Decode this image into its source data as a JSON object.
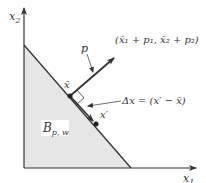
{
  "diagram": {
    "axes": {
      "x_label": "x",
      "x_label_sub": "1",
      "y_label": "x",
      "y_label_sub": "2"
    },
    "budget_set": {
      "label": "B",
      "label_sub": "p, w",
      "fill_color": "#e6e6e6"
    },
    "points": {
      "x_bar": "x̄",
      "x_prime": "x′"
    },
    "vectors": {
      "p_label": "p",
      "p_tip_label": "(x̄₁ + p₁, x̄₂ + p₂)",
      "delta_label": "Δx = (x′ − x̄)"
    },
    "colors": {
      "line": "#333333",
      "fill": "#e6e6e6",
      "background": "#ffffff"
    }
  }
}
